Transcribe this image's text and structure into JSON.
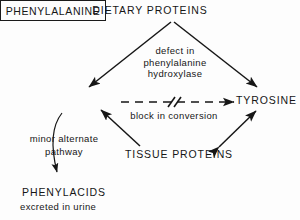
{
  "diagram": {
    "title": "DIETARY PROTEINS",
    "nodes": {
      "dietary_proteins": "DIETARY PROTEINS",
      "phenylalanine": "PHENYLALANINE",
      "tyrosine": "TYROSINE",
      "tissue_proteins": "TISSUE PROTEINS",
      "phenylacids": "PHENYLACIDS",
      "excreted_in_urine": "excreted in urine"
    },
    "annotations": {
      "defect_line1": "defect in",
      "defect_line2": "phenylalanine",
      "defect_line3": "hydroxylase",
      "block_in_conversion": "block in conversion",
      "minor_line1": "minor alternate",
      "minor_line2": "pathway"
    },
    "colors": {
      "ink": "#161616",
      "background": "#fdfdfd"
    }
  }
}
